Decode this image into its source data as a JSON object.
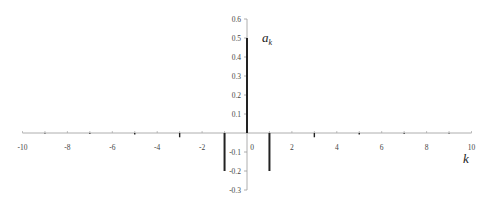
{
  "chart_data": {
    "type": "bar",
    "subtype": "stem",
    "title": "",
    "xlabel": "k",
    "ylabel": "a_k",
    "ylabel_main": "a",
    "ylabel_sub": "k",
    "xlim": [
      -10,
      10
    ],
    "ylim": [
      -0.3,
      0.6
    ],
    "x_ticks": [
      "-10",
      "-8",
      "-6",
      "-4",
      "-2",
      "0",
      "2",
      "4",
      "6",
      "8",
      "10"
    ],
    "y_ticks": [
      "0.6",
      "0.5",
      "0.4",
      "0.3",
      "0.2",
      "0.1",
      "-0.1",
      "-0.2",
      "-0.3"
    ],
    "grid": false,
    "legend": null,
    "x": [
      -9,
      -8,
      -7,
      -6,
      -5,
      -4,
      -3,
      -2,
      -1,
      0,
      1,
      2,
      3,
      4,
      5,
      6,
      7,
      8,
      9
    ],
    "values": [
      -0.0025,
      0,
      -0.004,
      0,
      -0.008,
      0,
      -0.0225,
      0,
      -0.2,
      0.5,
      -0.2,
      0,
      -0.0225,
      0,
      -0.008,
      0,
      -0.004,
      0,
      -0.0025
    ]
  },
  "colors": {
    "bars": "#222222",
    "axis": "#999999",
    "text": "#444444"
  }
}
